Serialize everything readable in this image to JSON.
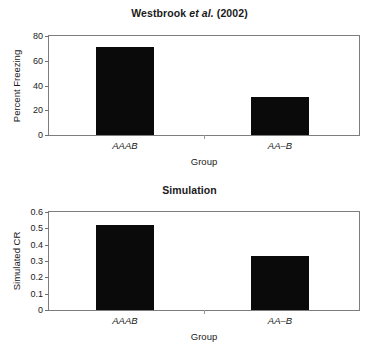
{
  "figure": {
    "background": "#ffffff",
    "bar_color": "#0a0a0a",
    "frame_color": "#7d7d7d"
  },
  "panels": [
    {
      "id": "westbrook",
      "title_prefix": "Westbrook ",
      "title_italic": "et al.",
      "title_suffix": " (2002)"
    },
    {
      "id": "simulation",
      "title": "Simulation"
    }
  ],
  "chart_data": [
    {
      "type": "bar",
      "title": "Westbrook et al. (2002)",
      "categories": [
        "AAAB",
        "AA–B"
      ],
      "values": [
        71,
        31
      ],
      "xlabel": "Group",
      "ylabel": "Percent Freezing",
      "ylim": [
        0,
        80
      ],
      "yticks": [
        0,
        20,
        40,
        60,
        80
      ],
      "ytick_labels": [
        "0",
        "20",
        "40",
        "60",
        "80"
      ],
      "grid": false,
      "legend": "none",
      "bar_color": "#0a0a0a"
    },
    {
      "type": "bar",
      "title": "Simulation",
      "categories": [
        "AAAB",
        "AA–B"
      ],
      "values": [
        0.52,
        0.33
      ],
      "xlabel": "Group",
      "ylabel": "Simulated CR",
      "ylim": [
        0,
        0.6
      ],
      "yticks": [
        0,
        0.1,
        0.2,
        0.3,
        0.4,
        0.5,
        0.6
      ],
      "ytick_labels": [
        "0",
        "0.1",
        "0.2",
        "0.3",
        "0.4",
        "0.5",
        "0.6"
      ],
      "grid": false,
      "legend": "none",
      "bar_color": "#0a0a0a"
    }
  ]
}
